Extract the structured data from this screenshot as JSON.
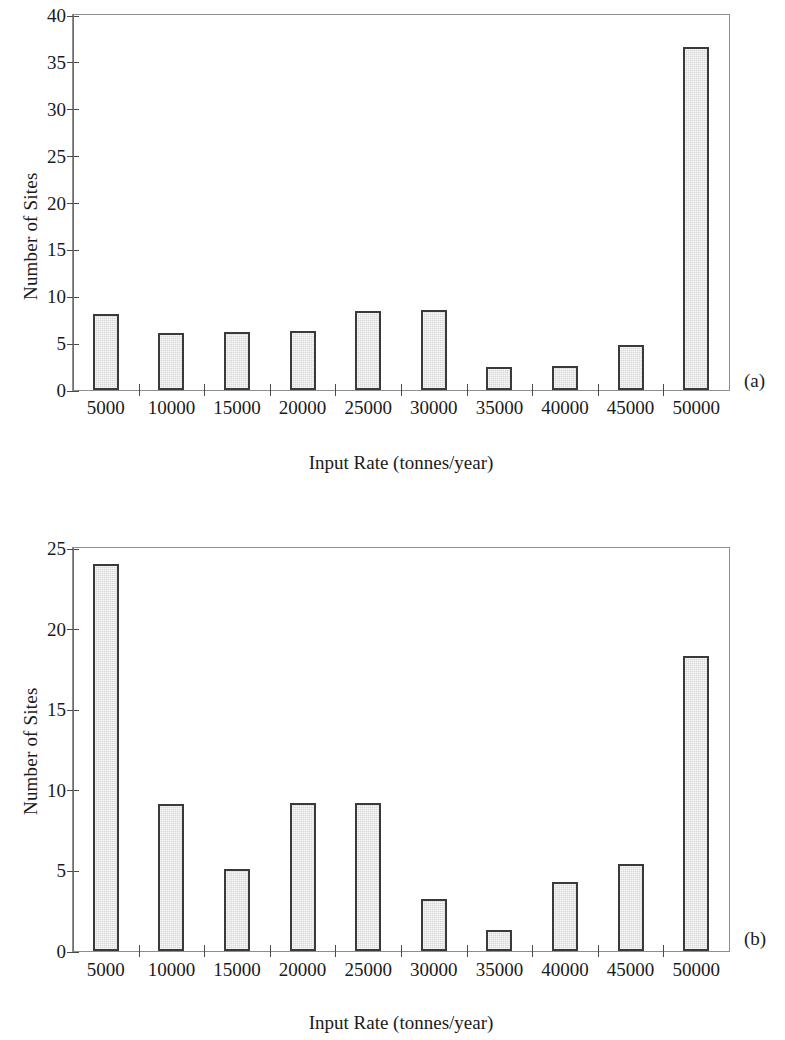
{
  "figure": {
    "panels": [
      {
        "tag": "(a)",
        "xlabel": "Input Rate (tonnes/year)",
        "ylabel": "Number of Sites"
      },
      {
        "tag": "(b)",
        "xlabel": "Input Rate (tonnes/year)",
        "ylabel": "Number of Sites"
      }
    ]
  },
  "chart_data": [
    {
      "type": "bar",
      "panel": "(a)",
      "title": "",
      "xlabel": "Input Rate (tonnes/year)",
      "ylabel": "Number of Sites",
      "categories": [
        "5000",
        "10000",
        "15000",
        "20000",
        "25000",
        "30000",
        "35000",
        "40000",
        "45000",
        "50000"
      ],
      "values": [
        8.1,
        6.1,
        6.2,
        6.3,
        8.4,
        8.5,
        2.5,
        2.6,
        4.8,
        36.6
      ],
      "ylim": [
        0,
        40
      ],
      "yticks": [
        "0",
        "5",
        "10",
        "15",
        "20",
        "25",
        "30",
        "35",
        "40"
      ],
      "ytick_values": [
        0,
        5,
        10,
        15,
        20,
        25,
        30,
        35,
        40
      ],
      "grid": false,
      "legend": "none"
    },
    {
      "type": "bar",
      "panel": "(b)",
      "title": "",
      "xlabel": "Input Rate (tonnes/year)",
      "ylabel": "Number of Sites",
      "categories": [
        "5000",
        "10000",
        "15000",
        "20000",
        "25000",
        "30000",
        "35000",
        "40000",
        "45000",
        "50000"
      ],
      "values": [
        24.0,
        9.1,
        5.1,
        9.2,
        9.2,
        3.2,
        1.3,
        4.3,
        5.4,
        18.3
      ],
      "ylim": [
        0,
        25
      ],
      "yticks": [
        "0",
        "5",
        "10",
        "15",
        "20",
        "25"
      ],
      "ytick_values": [
        0,
        5,
        10,
        15,
        20,
        25
      ],
      "grid": false,
      "legend": "none"
    }
  ],
  "style": {
    "bar_fill": "#d8d8d8",
    "bar_border": "#3a3a3a",
    "axis_color": "#8d8d8d",
    "text_color": "#1a1a1a"
  }
}
